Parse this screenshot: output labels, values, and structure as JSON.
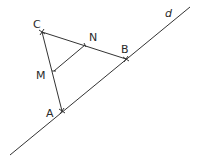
{
  "diagram": {
    "line_color": "#333333",
    "line_d": {
      "label": "d",
      "x1": 10,
      "y1": 155,
      "x2": 190,
      "y2": 7,
      "label_x": 165,
      "label_y": 17
    },
    "points": {
      "C": {
        "label": "C",
        "x": 42,
        "y": 32,
        "label_x": 33,
        "label_y": 28
      },
      "N": {
        "label": "N",
        "x": 85,
        "y": 45,
        "label_x": 89,
        "label_y": 41
      },
      "B": {
        "label": "B",
        "x": 126,
        "y": 59,
        "label_x": 121,
        "label_y": 53
      },
      "M": {
        "label": "M",
        "x": 54,
        "y": 71,
        "label_x": 36,
        "label_y": 79
      },
      "A": {
        "label": "A",
        "x": 62,
        "y": 111,
        "label_x": 46,
        "label_y": 117
      }
    },
    "segments": [
      {
        "from": "C",
        "to": "A"
      },
      {
        "from": "C",
        "to": "B"
      },
      {
        "from": "M",
        "to": "N"
      }
    ]
  }
}
